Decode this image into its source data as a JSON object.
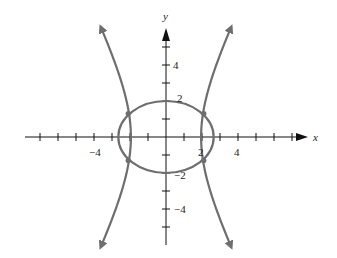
{
  "chart_data": {
    "type": "line",
    "title": "",
    "xlabel": "x",
    "ylabel": "y",
    "xlim": [
      -8,
      7.5
    ],
    "ylim": [
      -6,
      6
    ],
    "grid": false,
    "legend": null,
    "x_tick_labels": [
      "-4",
      "2",
      "4"
    ],
    "y_tick_labels": [
      "4",
      "2",
      "-2",
      "-4"
    ],
    "series": [
      {
        "name": "ellipse",
        "kind": "ellipse",
        "center": [
          0,
          0
        ],
        "semi_axis_x": 2.65,
        "semi_axis_y": 2.0,
        "color": "#6e6e6e"
      },
      {
        "name": "hyperbola",
        "kind": "hyperbola",
        "vertices_x": [
          -2,
          2
        ],
        "branches": "left-right, arrows on all four ends",
        "color": "#6e6e6e"
      }
    ],
    "intersection_points": [
      [
        -2.1,
        1.3
      ],
      [
        2.1,
        1.3
      ],
      [
        -2.1,
        -1.3
      ],
      [
        2.1,
        -1.3
      ]
    ],
    "layout": {
      "origin_px": [
        166,
        137
      ],
      "unit_px": 18,
      "axis_color": "#111111",
      "curve_color": "#6e6e6e"
    }
  },
  "labels": {
    "x_axis": "x",
    "y_axis": "y",
    "x_neg4": "−4",
    "x_2": "2",
    "x_4": "4",
    "y_4": "4",
    "y_2": "2",
    "y_neg2": "−2",
    "y_neg4": "−4"
  }
}
